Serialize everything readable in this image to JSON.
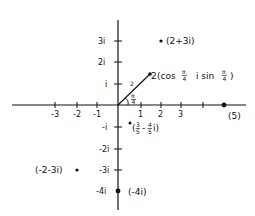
{
  "diagram": {
    "type": "complex-plane",
    "colors": {
      "ink": "#111111",
      "background": "#ffffff"
    },
    "origin_px": [
      118,
      105
    ],
    "unit_px": {
      "x": 21.3,
      "y": 21.5
    },
    "axes": {
      "x_ticks": [
        {
          "value": -3,
          "label": "-3"
        },
        {
          "value": -2,
          "label": "-2"
        },
        {
          "value": -1,
          "label": "-1"
        },
        {
          "value": 1,
          "label": "1"
        },
        {
          "value": 2,
          "label": "2"
        },
        {
          "value": 3,
          "label": "3"
        },
        {
          "value": 4,
          "label": ""
        }
      ],
      "y_ticks": [
        {
          "value": 3,
          "label": "3i"
        },
        {
          "value": 2,
          "label": "2i"
        },
        {
          "value": 1,
          "label": "i"
        },
        {
          "value": -1,
          "label": "-i"
        },
        {
          "value": -2,
          "label": "-2i"
        },
        {
          "value": -3,
          "label": "-3i"
        },
        {
          "value": -4,
          "label": ""
        }
      ]
    },
    "points": [
      {
        "re": 2,
        "im": 3,
        "label": "(2+3i)",
        "label_side": "right"
      },
      {
        "re": 1.414,
        "im": 1.414,
        "label": "2(cos π/4  i sin π/4)",
        "label_side": "right"
      },
      {
        "re": 0.6,
        "im": -0.8,
        "label": "(3/5 - 4/5 i)",
        "label_side": "below-right"
      },
      {
        "re": -2,
        "im": -3,
        "label": "(-2-3i)",
        "label_side": "left"
      },
      {
        "re": 0,
        "im": -4,
        "label": "(-4i)",
        "label_side": "right"
      },
      {
        "re": 5,
        "im": 0,
        "label": "(5)",
        "label_side": "below"
      }
    ],
    "vector": {
      "from": [
        0,
        0
      ],
      "to": [
        1.414,
        1.414
      ],
      "length_label": "2",
      "angle_label": "π/4"
    }
  },
  "labels": {
    "p1": "(2+3i)",
    "p2_coef": "2",
    "p2_cos": "(cos",
    "p2_pi1": "π",
    "p2_four1": "4",
    "p2_isin": "i sin",
    "p2_pi2": "π",
    "p2_four2": "4",
    "p2_close": ")",
    "p3_open": "(",
    "p3_n1": "3",
    "p3_d1": "5",
    "p3_minus": "-",
    "p3_n2": "4",
    "p3_d2": "5",
    "p3_i": "i)",
    "p4": "(-2-3i)",
    "p5": "(-4i)",
    "p6": "(5)",
    "radius": "2",
    "angle_pi": "π",
    "angle_four": "4",
    "x_m3": "-3",
    "x_m2": "-2",
    "x_m1": "-1",
    "x_1": "1",
    "x_2": "2",
    "x_3": "3",
    "y_3": "3i",
    "y_2": "2i",
    "y_1": "i",
    "y_m1": "-i",
    "y_m2": "-2i",
    "y_m3": "-3i",
    "y_m4": "-4i"
  }
}
